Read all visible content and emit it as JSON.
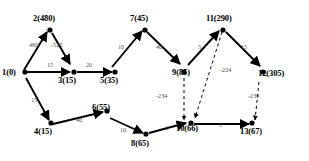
{
  "diagram": {
    "type": "directed-graph",
    "title": "",
    "width": 309,
    "height": 161,
    "node_label_format": "id(distance)",
    "nodes": [
      {
        "id": "1",
        "label": "1(0)",
        "distance": 0,
        "x": 22,
        "y": 74
      },
      {
        "id": "2",
        "label": "2(480)",
        "distance": 480,
        "x": 48,
        "y": 22
      },
      {
        "id": "3",
        "label": "3(15)",
        "distance": 15,
        "x": 72,
        "y": 75
      },
      {
        "id": "4",
        "label": "4(15)",
        "distance": 15,
        "x": 47,
        "y": 128
      },
      {
        "id": "5",
        "label": "5(35)",
        "distance": 35,
        "x": 106,
        "y": 75
      },
      {
        "id": "6",
        "label": "6(55)",
        "distance": 55,
        "x": 104,
        "y": 115
      },
      {
        "id": "7",
        "label": "7(45)",
        "distance": 45,
        "x": 142,
        "y": 22
      },
      {
        "id": "8",
        "label": "8(65)",
        "distance": 65,
        "x": 143,
        "y": 140
      },
      {
        "id": "9",
        "label": "9(85)",
        "distance": 85,
        "x": 183,
        "y": 69
      },
      {
        "id": "10",
        "label": "10(66)",
        "distance": 66,
        "x": 190,
        "y": 128
      },
      {
        "id": "11",
        "label": "11(290)",
        "distance": 290,
        "x": 222,
        "y": 22
      },
      {
        "id": "12",
        "label": "12(305)",
        "distance": 305,
        "x": 262,
        "y": 75
      },
      {
        "id": "13",
        "label": "13(67)",
        "distance": 67,
        "x": 249,
        "y": 140
      }
    ],
    "edges": [
      {
        "from": "1",
        "to": "2",
        "weight": "480",
        "style": "solid",
        "label_x": 34,
        "label_y": 46
      },
      {
        "from": "2",
        "to": "3",
        "weight": "-525",
        "style": "solid",
        "label_x": 57,
        "label_y": 46
      },
      {
        "from": "1",
        "to": "3",
        "weight": "15",
        "style": "solid",
        "label_x": 50,
        "label_y": 66
      },
      {
        "from": "3",
        "to": "5",
        "weight": "20",
        "style": "solid",
        "label_x": 86,
        "label_y": 66
      },
      {
        "from": "1",
        "to": "4",
        "weight": "15",
        "style": "solid",
        "label_x": 31,
        "label_y": 101
      },
      {
        "from": "4",
        "to": "6",
        "weight": "40",
        "style": "solid",
        "label_x": 78,
        "label_y": 121
      },
      {
        "from": "5",
        "to": "7",
        "weight": "10",
        "style": "solid",
        "label_x": 121,
        "label_y": 48
      },
      {
        "from": "7",
        "to": "9",
        "weight": "40",
        "style": "solid",
        "label_x": 159,
        "label_y": 48
      },
      {
        "from": "9",
        "to": "11",
        "weight": "5",
        "style": "solid",
        "label_x": 199,
        "label_y": 48
      },
      {
        "from": "11",
        "to": "12",
        "weight": "15",
        "style": "solid",
        "label_x": 243,
        "label_y": 48
      },
      {
        "from": "6",
        "to": "8",
        "weight": "10",
        "style": "solid",
        "label_x": 122,
        "label_y": 131
      },
      {
        "from": "8",
        "to": "10",
        "weight": "1",
        "style": "solid",
        "label_x": 166,
        "label_y": 129
      },
      {
        "from": "10",
        "to": "13",
        "weight": "1",
        "style": "solid",
        "label_x": 219,
        "label_y": 126
      },
      {
        "from": "9",
        "to": "10",
        "weight": "-234",
        "style": "dashed",
        "label_x": 161,
        "label_y": 97
      },
      {
        "from": "11",
        "to": "10",
        "weight": "-224",
        "style": "dashed",
        "label_x": 224,
        "label_y": 71
      },
      {
        "from": "12",
        "to": "13",
        "weight": "-239",
        "style": "dashed",
        "label_x": 251,
        "label_y": 97
      }
    ]
  }
}
